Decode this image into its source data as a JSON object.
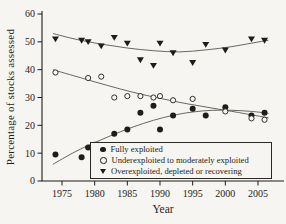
{
  "figure": {
    "background": "#f6f5f1",
    "ink": "#1f1d1a",
    "trend_line_color": "#5a564f"
  },
  "chart_data": {
    "type": "scatter",
    "title": "",
    "xlabel": "Year",
    "ylabel": "Percentage of stocks assessed",
    "xlim": [
      1973,
      2007.5
    ],
    "ylim": [
      0,
      60
    ],
    "x_ticks": [
      1975,
      1980,
      1985,
      1990,
      1995,
      2000,
      2005
    ],
    "y_ticks": [
      0,
      10,
      20,
      30,
      40,
      50,
      60
    ],
    "grid": false,
    "legend_position": "inside-bottom-right",
    "series": [
      {
        "name": "Fully exploited",
        "marker": "filled-circle",
        "points": [
          [
            1974,
            9.5
          ],
          [
            1978,
            8.5
          ],
          [
            1979,
            12
          ],
          [
            1980,
            13
          ],
          [
            1983,
            17
          ],
          [
            1985,
            18.5
          ],
          [
            1987,
            24.5
          ],
          [
            1989,
            27
          ],
          [
            1990,
            18.5
          ],
          [
            1992,
            23.5
          ],
          [
            1995,
            26
          ],
          [
            1997,
            23.5
          ],
          [
            2000,
            26.5
          ],
          [
            2004,
            23.5
          ],
          [
            2006,
            24.5
          ]
        ],
        "trend": [
          [
            1973.6,
            6
          ],
          [
            1977,
            10.5
          ],
          [
            1980,
            13.8
          ],
          [
            1983,
            16.8
          ],
          [
            1986,
            19.5
          ],
          [
            1989,
            21.8
          ],
          [
            1992,
            23.6
          ],
          [
            1995,
            24.8
          ],
          [
            1998,
            25.4
          ],
          [
            2001,
            25.4
          ],
          [
            2004,
            25
          ],
          [
            2006.6,
            24.3
          ]
        ]
      },
      {
        "name": "Underexploited to moderately exploited",
        "marker": "open-circle",
        "points": [
          [
            1974,
            39
          ],
          [
            1979,
            37
          ],
          [
            1981,
            37.5
          ],
          [
            1983,
            30
          ],
          [
            1985,
            30.5
          ],
          [
            1987,
            30.5
          ],
          [
            1989,
            30
          ],
          [
            1990,
            30.5
          ],
          [
            1992,
            29
          ],
          [
            1995,
            29.5
          ],
          [
            2000,
            25
          ],
          [
            2004,
            22.5
          ],
          [
            2006,
            22
          ]
        ],
        "trend": [
          [
            1973.6,
            40
          ],
          [
            1978,
            37
          ],
          [
            1982,
            34.3
          ],
          [
            1986,
            31.8
          ],
          [
            1990,
            29.7
          ],
          [
            1994,
            27.8
          ],
          [
            1998,
            26.2
          ],
          [
            2002,
            24.6
          ],
          [
            2006.6,
            22.7
          ]
        ]
      },
      {
        "name": "Overexploited, depleted or recovering",
        "marker": "filled-triangle-down",
        "points": [
          [
            1974,
            51
          ],
          [
            1978,
            50.5
          ],
          [
            1979,
            50
          ],
          [
            1981,
            48.5
          ],
          [
            1983,
            51.5
          ],
          [
            1985,
            49.5
          ],
          [
            1987,
            43.5
          ],
          [
            1989,
            41.5
          ],
          [
            1990,
            49.5
          ],
          [
            1992,
            46
          ],
          [
            1995,
            42.5
          ],
          [
            1997,
            49
          ],
          [
            2000,
            47
          ],
          [
            2004,
            51
          ],
          [
            2006,
            50.5
          ]
        ],
        "trend": [
          [
            1973.6,
            53
          ],
          [
            1977,
            51
          ],
          [
            1981,
            49.2
          ],
          [
            1985,
            47.8
          ],
          [
            1989,
            46.8
          ],
          [
            1993,
            46.4
          ],
          [
            1997,
            47.1
          ],
          [
            2001,
            48.3
          ],
          [
            2006.6,
            50.6
          ]
        ]
      }
    ]
  }
}
